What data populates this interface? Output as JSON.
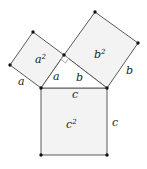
{
  "diagram": {
    "type": "pythagorean-theorem",
    "colors": {
      "square_fill": "#f3f3f3",
      "stroke": "#5a5a5a",
      "vertex": "#111111",
      "label": "#222222"
    },
    "squares": {
      "a_square": {
        "label_base": "a",
        "label_exp": "2"
      },
      "b_square": {
        "label_base": "b",
        "label_exp": "2"
      },
      "c_square": {
        "label_base": "c",
        "label_exp": "2"
      }
    },
    "side_labels": {
      "a_outer": "a",
      "a_inner": "a",
      "b_inner": "b",
      "b_outer": "b",
      "c_top": "c",
      "c_right": "c"
    }
  }
}
